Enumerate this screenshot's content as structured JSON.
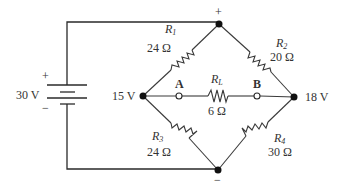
{
  "diagram": {
    "type": "Wheatstone bridge circuit",
    "source": {
      "label": "30 V",
      "plus": "+",
      "minus": "−"
    },
    "nodes": {
      "top": {
        "polarity": "+"
      },
      "bottom": {
        "polarity": "−"
      },
      "left": {
        "voltage": "15 V"
      },
      "right": {
        "voltage": "18 V"
      }
    },
    "terminals": {
      "a": "A",
      "b": "B"
    },
    "resistors": [
      {
        "id": "R1",
        "name": "R",
        "sub": "1",
        "value": "24 Ω",
        "position": "top-left"
      },
      {
        "id": "R2",
        "name": "R",
        "sub": "2",
        "value": "20 Ω",
        "position": "top-right"
      },
      {
        "id": "R3",
        "name": "R",
        "sub": "3",
        "value": "24 Ω",
        "position": "bottom-left"
      },
      {
        "id": "R4",
        "name": "R",
        "sub": "4",
        "value": "30 Ω",
        "position": "bottom-right"
      },
      {
        "id": "RL",
        "name": "R",
        "sub": "L",
        "value": "6 Ω",
        "position": "center"
      }
    ],
    "colors": {
      "wire": "#2a2a2a",
      "text": "#333333",
      "background": "#ffffff"
    }
  }
}
